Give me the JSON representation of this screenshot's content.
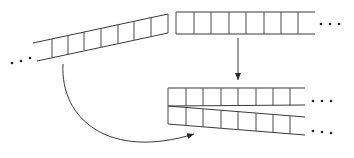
{
  "diagram": {
    "type": "strip-rearrangement",
    "colors": {
      "stroke": "#3a3a3a",
      "background": "#ffffff"
    },
    "strips": [
      {
        "id": "tilted-left-strip",
        "description": "tilted strip of cells with leading ellipsis",
        "cells": 7,
        "ellipsis": "left"
      },
      {
        "id": "top-right-strip",
        "description": "horizontal strip of cells with trailing ellipsis",
        "cells": 8,
        "ellipsis": "right"
      },
      {
        "id": "merged-upper-strip",
        "description": "horizontal strip in result",
        "cells": 8,
        "ellipsis": "right"
      },
      {
        "id": "merged-lower-strip",
        "description": "diverging strip in result",
        "cells": 8,
        "ellipsis": "right"
      }
    ],
    "arrows": [
      {
        "id": "down-arrow",
        "from": "top-right-strip",
        "to": "merged-upper-strip",
        "shape": "straight"
      },
      {
        "id": "curved-arrow",
        "from": "tilted-left-strip",
        "to": "merged-lower-strip",
        "shape": "curved"
      }
    ],
    "ellipsis_glyph": "• • •"
  }
}
